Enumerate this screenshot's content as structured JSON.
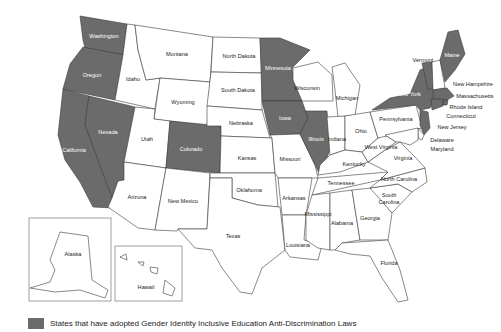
{
  "map": {
    "title": "",
    "colors": {
      "adopted": "#6b6b6b",
      "not_adopted": "#ffffff",
      "border": "#3a3a3a"
    },
    "states": [
      {
        "name": "Washington",
        "adopted": true
      },
      {
        "name": "Oregon",
        "adopted": true
      },
      {
        "name": "California",
        "adopted": true
      },
      {
        "name": "Nevada",
        "adopted": true
      },
      {
        "name": "Idaho",
        "adopted": false
      },
      {
        "name": "Montana",
        "adopted": false
      },
      {
        "name": "Wyoming",
        "adopted": false
      },
      {
        "name": "Utah",
        "adopted": false
      },
      {
        "name": "Colorado",
        "adopted": true
      },
      {
        "name": "Arizona",
        "adopted": false
      },
      {
        "name": "New Mexico",
        "adopted": false
      },
      {
        "name": "North Dakota",
        "adopted": false
      },
      {
        "name": "South Dakota",
        "adopted": false
      },
      {
        "name": "Nebraska",
        "adopted": false
      },
      {
        "name": "Kansas",
        "adopted": false
      },
      {
        "name": "Oklahoma",
        "adopted": false
      },
      {
        "name": "Texas",
        "adopted": false
      },
      {
        "name": "Minnesota",
        "adopted": true
      },
      {
        "name": "Iowa",
        "adopted": true
      },
      {
        "name": "Missouri",
        "adopted": false
      },
      {
        "name": "Arkansas",
        "adopted": false
      },
      {
        "name": "Louisiana",
        "adopted": false
      },
      {
        "name": "Wisconsin",
        "adopted": false
      },
      {
        "name": "Illinois",
        "adopted": true
      },
      {
        "name": "Michigan",
        "adopted": false
      },
      {
        "name": "Indiana",
        "adopted": false
      },
      {
        "name": "Ohio",
        "adopted": false
      },
      {
        "name": "Kentucky",
        "adopted": false
      },
      {
        "name": "Tennessee",
        "adopted": false
      },
      {
        "name": "Mississippi",
        "adopted": false
      },
      {
        "name": "Alabama",
        "adopted": false
      },
      {
        "name": "Georgia",
        "adopted": false
      },
      {
        "name": "Florida",
        "adopted": false
      },
      {
        "name": "South Carolina",
        "adopted": false
      },
      {
        "name": "North Carolina",
        "adopted": false
      },
      {
        "name": "Virginia",
        "adopted": false
      },
      {
        "name": "West Virginia",
        "adopted": false
      },
      {
        "name": "Pennsylvania",
        "adopted": false
      },
      {
        "name": "New York",
        "adopted": true
      },
      {
        "name": "Vermont",
        "adopted": true
      },
      {
        "name": "Maine",
        "adopted": true
      },
      {
        "name": "New Hampshire",
        "adopted": false
      },
      {
        "name": "Massachusetts",
        "adopted": true
      },
      {
        "name": "Rhode Island",
        "adopted": true
      },
      {
        "name": "Connecticut",
        "adopted": true
      },
      {
        "name": "New Jersey",
        "adopted": true
      },
      {
        "name": "Delaware",
        "adopted": false
      },
      {
        "name": "Maryland",
        "adopted": false
      },
      {
        "name": "Alaska",
        "adopted": false
      },
      {
        "name": "Hawaii",
        "adopted": false
      }
    ],
    "labels": {
      "washington": "Washington",
      "oregon": "Oregon",
      "california": "California",
      "nevada": "Nevada",
      "idaho": "Idaho",
      "montana": "Montana",
      "wyoming": "Wyoming",
      "utah": "Utah",
      "colorado": "Colorado",
      "arizona": "Arizona",
      "new_mexico": "New Mexico",
      "north_dakota": "North Dakota",
      "south_dakota": "South Dakota",
      "nebraska": "Nebraska",
      "kansas": "Kansas",
      "oklahoma": "Oklahoma",
      "texas": "Texas",
      "minnesota": "Minnesota",
      "iowa": "Iowa",
      "missouri": "Missouri",
      "arkansas": "Arkansas",
      "louisiana": "Louisiana",
      "wisconsin": "Wisconsin",
      "illinois": "Illinois",
      "michigan": "Michigan",
      "indiana": "Indiana",
      "ohio": "Ohio",
      "kentucky": "Kentucky",
      "tennessee": "Tennessee",
      "mississippi": "Mississippi",
      "alabama": "Alabama",
      "georgia": "Georgia",
      "florida": "Florida",
      "south_carolina_1": "South",
      "south_carolina_2": "Carolina",
      "north_carolina": "North Carolina",
      "virginia": "Virginia",
      "west_virginia": "West Virginia",
      "pennsylvania": "Pennsylvania",
      "new_york": "New York",
      "vermont": "Vermont",
      "maine": "Maine",
      "new_hampshire": "New Hampshire",
      "massachusetts": "Massachusetts",
      "rhode_island": "Rhode Island",
      "connecticut": "Connecticut",
      "new_jersey": "New Jersey",
      "delaware": "Delaware",
      "maryland": "Maryland",
      "alaska": "Alaska",
      "hawaii": "Hawaii"
    }
  },
  "legend": {
    "swatch_color": "#6b6b6b",
    "label": "States that have adopted Gender Identity Inclusive Education Anti-Discrimination Laws"
  }
}
